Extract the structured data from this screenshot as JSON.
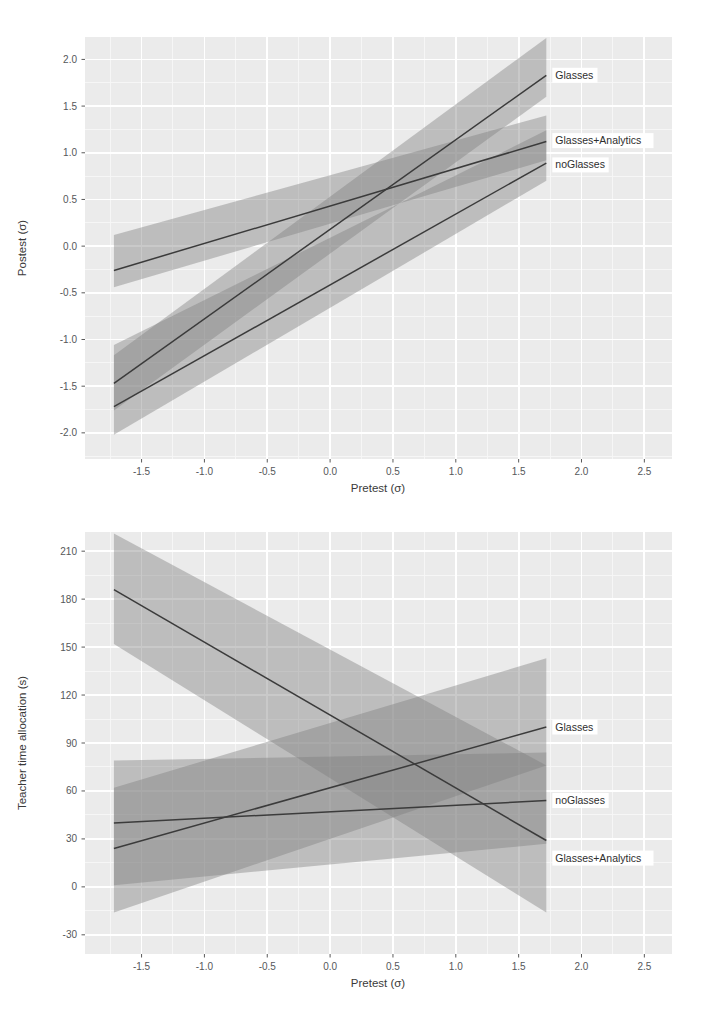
{
  "page": {
    "width": 709,
    "height": 1020,
    "background": "#ffffff"
  },
  "style": {
    "panel_background": "#ebebeb",
    "grid_major": "#ffffff",
    "grid_minor": "#f7f7f7",
    "line_color": "#3b3b3b",
    "ribbon_color": "#7f7f7f",
    "tick_color": "#5a5a5a",
    "text_color": "#3a3a3a",
    "label_box_background": "#ffffff"
  },
  "chart_data": [
    {
      "id": "postest-vs-pretest",
      "type": "line",
      "title": "",
      "subtitle": "",
      "xlabel": "Pretest (σ)",
      "ylabel": "Postest (σ)",
      "xlim": [
        -1.95,
        2.72
      ],
      "ylim": [
        -2.28,
        2.24
      ],
      "xticks": [
        -1.5,
        -1.0,
        -0.5,
        0.0,
        0.5,
        1.0,
        1.5,
        2.0,
        2.5
      ],
      "xticklabels": [
        "-1.5",
        "-1.0",
        "-0.5",
        "0.0",
        "0.5",
        "1.0",
        "1.5",
        "2.0",
        "2.5"
      ],
      "yticks": [
        2.0,
        1.5,
        1.0,
        0.5,
        0.0,
        -0.5,
        -1.0,
        -1.5,
        -2.0
      ],
      "yticklabels": [
        "2.0",
        "1.5",
        "1.0",
        "0.5",
        "0.0",
        "-0.5",
        "-1.0",
        "-1.5",
        "-2.0"
      ],
      "grid": true,
      "legend_position": "right-inline-labels",
      "x_range_of_fits": [
        -1.72,
        1.72
      ],
      "series": [
        {
          "name": "Glasses",
          "label": "Glasses",
          "label_y": 1.83,
          "x": [
            -1.72,
            1.72
          ],
          "y": [
            -1.47,
            1.83
          ],
          "ribbon_lower": [
            -1.76,
            1.6
          ],
          "ribbon_upper": [
            -1.17,
            2.23
          ]
        },
        {
          "name": "Glasses+Analytics",
          "label": "Glasses+Analytics",
          "label_y": 1.13,
          "x": [
            -1.72,
            1.72
          ],
          "y": [
            -0.26,
            1.12
          ],
          "ribbon_lower": [
            -0.44,
            0.92
          ],
          "ribbon_upper": [
            0.12,
            1.4
          ]
        },
        {
          "name": "noGlasses",
          "label": "noGlasses",
          "label_y": 0.87,
          "x": [
            -1.72,
            1.72
          ],
          "y": [
            -1.72,
            0.89
          ],
          "ribbon_lower": [
            -2.02,
            0.7
          ],
          "ribbon_upper": [
            -1.06,
            1.24
          ]
        }
      ]
    },
    {
      "id": "teacher-time-vs-pretest",
      "type": "line",
      "title": "",
      "subtitle": "",
      "xlabel": "Pretest (σ)",
      "ylabel": "Teacher time allocation (s)",
      "xlim": [
        -1.95,
        2.72
      ],
      "ylim": [
        -42,
        222
      ],
      "xticks": [
        -1.5,
        -1.0,
        -0.5,
        0.0,
        0.5,
        1.0,
        1.5,
        2.0,
        2.5
      ],
      "xticklabels": [
        "-1.5",
        "-1.0",
        "-0.5",
        "0.0",
        "0.5",
        "1.0",
        "1.5",
        "2.0",
        "2.5"
      ],
      "yticks": [
        210,
        180,
        150,
        120,
        90,
        60,
        30,
        0,
        -30
      ],
      "yticklabels": [
        "210",
        "180",
        "150",
        "120",
        "90",
        "60",
        "30",
        "0",
        "-30"
      ],
      "grid": true,
      "legend_position": "right-inline-labels",
      "x_range_of_fits": [
        -1.72,
        1.72
      ],
      "series": [
        {
          "name": "Glasses",
          "label": "Glasses",
          "label_y": 100,
          "x": [
            -1.72,
            1.72
          ],
          "y": [
            24,
            100
          ],
          "ribbon_lower": [
            -16,
            76
          ],
          "ribbon_upper": [
            62,
            143
          ]
        },
        {
          "name": "noGlasses",
          "label": "noGlasses",
          "label_y": 54,
          "x": [
            -1.72,
            1.72
          ],
          "y": [
            40,
            54
          ],
          "ribbon_lower": [
            1,
            27
          ],
          "ribbon_upper": [
            79,
            84
          ]
        },
        {
          "name": "Glasses+Analytics",
          "label": "Glasses+Analytics",
          "label_y": 18,
          "x": [
            -1.72,
            1.72
          ],
          "y": [
            186,
            29
          ],
          "ribbon_lower": [
            152,
            -16
          ],
          "ribbon_upper": [
            221,
            76
          ]
        }
      ]
    }
  ]
}
